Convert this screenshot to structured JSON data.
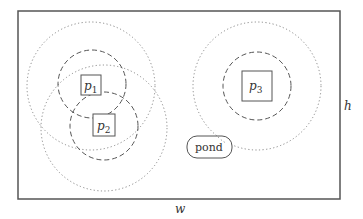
{
  "diagram": {
    "area": {
      "x": 18,
      "y": 11,
      "width": 322,
      "height": 188,
      "stroke": "#555555"
    },
    "width_label": "w",
    "height_label": "h",
    "points": [
      {
        "id": "p1",
        "base": "p",
        "sub": "1",
        "cx": 91,
        "cy": 84,
        "box": 20,
        "inner_r": 34,
        "outer_r": 64
      },
      {
        "id": "p2",
        "base": "p",
        "sub": "2",
        "cx": 104,
        "cy": 126,
        "box": 22,
        "inner_r": 34,
        "outer_r": 63
      },
      {
        "id": "p3",
        "base": "p",
        "sub": "3",
        "cx": 257,
        "cy": 86,
        "box": 30,
        "inner_r": 34,
        "outer_r": 64
      }
    ],
    "obstacle": {
      "label": "pond",
      "x": 187,
      "y": 136,
      "width": 45,
      "height": 22
    }
  }
}
